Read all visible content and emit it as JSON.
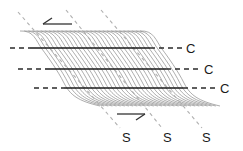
{
  "diagram": {
    "colors": {
      "foliation": "#8a8a8a",
      "c_plane": "#1a1a1a",
      "s_plane": "#b0b0b0",
      "arrow": "#333333"
    },
    "c_planes": [
      {
        "label": "C",
        "y": 48,
        "dash_start": 10,
        "solid_start": 30,
        "solid_end": 150,
        "dash_end": 183,
        "label_x": 186
      },
      {
        "label": "C",
        "y": 69,
        "dash_start": 18,
        "solid_start": 45,
        "solid_end": 166,
        "dash_end": 201,
        "label_x": 204
      },
      {
        "label": "C",
        "y": 88,
        "dash_start": 34,
        "solid_start": 64,
        "solid_end": 183,
        "dash_end": 217,
        "label_x": 220
      }
    ],
    "s_planes": [
      {
        "label": "S",
        "x1": 18,
        "y1": 12,
        "x2": 120,
        "y2": 128,
        "label_x": 122,
        "label_y": 142
      },
      {
        "label": "S",
        "x1": 66,
        "y1": 10,
        "x2": 162,
        "y2": 128,
        "label_x": 163,
        "label_y": 142
      },
      {
        "label": "S",
        "x1": 101,
        "y1": 10,
        "x2": 202,
        "y2": 128,
        "label_x": 202,
        "label_y": 142
      }
    ],
    "shear_arrows": [
      {
        "name": "top-sinistral-arrow",
        "direction": "left",
        "x1": 72,
        "y1": 24,
        "x2": 43,
        "y2": 24
      },
      {
        "name": "bottom-dextral-arrow",
        "direction": "right",
        "x1": 117,
        "y1": 114,
        "x2": 145,
        "y2": 114
      }
    ],
    "foliation_band": {
      "count": 30,
      "top_left": [
        20,
        31
      ],
      "top_right": [
        140,
        31
      ],
      "bottom_left": [
        72,
        108
      ],
      "curve_width": 38,
      "curve_height": 77
    }
  }
}
